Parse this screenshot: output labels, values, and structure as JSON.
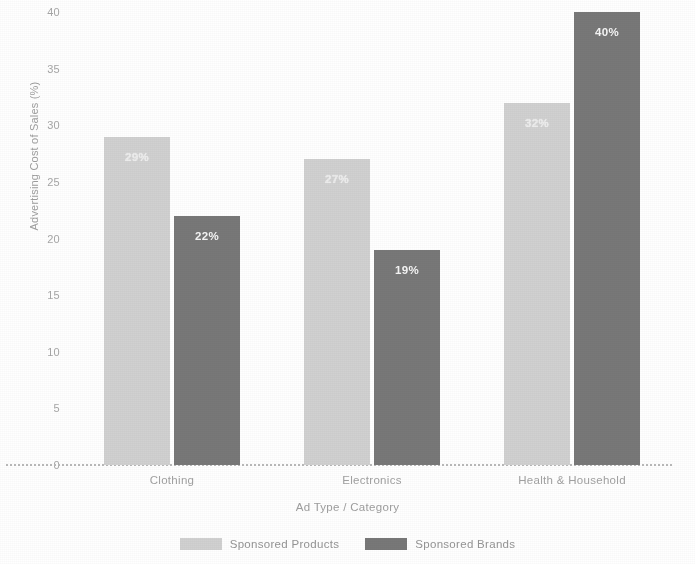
{
  "chart_data": {
    "type": "bar",
    "title": "",
    "xlabel": "Ad Type / Category",
    "ylabel": "Advertising Cost of Sales (%)",
    "categories": [
      "Clothing",
      "Electronics",
      "Health & Household"
    ],
    "series": [
      {
        "name": "Sponsored Products",
        "color": "#d5d5d5",
        "values": [
          29,
          27,
          32
        ],
        "labels": [
          "29%",
          "27%",
          "32%"
        ]
      },
      {
        "name": "Sponsored Brands",
        "color": "#6e6e6e",
        "values": [
          22,
          19,
          40
        ],
        "labels": [
          "22%",
          "19%",
          "40%"
        ]
      }
    ],
    "ylim": [
      0,
      40
    ],
    "yticks": [
      0,
      5,
      10,
      15,
      20,
      25,
      30,
      35,
      40
    ],
    "ytick_labels": [
      "0",
      "5",
      "10",
      "15",
      "20",
      "25",
      "30",
      "35",
      "40"
    ],
    "grid": false,
    "legend_position": "bottom-center",
    "background": "#ffffff"
  }
}
